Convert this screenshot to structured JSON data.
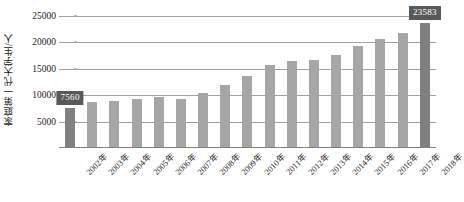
{
  "chart_data": {
    "type": "bar",
    "title": "",
    "xlabel": "",
    "ylabel": "家庭第一代大学生/人",
    "ylim": [
      0,
      25000
    ],
    "yticks": [
      5000,
      10000,
      15000,
      20000,
      25000
    ],
    "ytick_labels": [
      "5000",
      "10000",
      "15000",
      "20000",
      "25000"
    ],
    "grid": true,
    "legend": false,
    "categories": [
      "2002年",
      "2003年",
      "2004年",
      "2005年",
      "2006年",
      "2007年",
      "2008年",
      "2009年",
      "2010年",
      "2011年",
      "2012年",
      "2013年",
      "2014年",
      "2015年",
      "2016年",
      "2017年",
      "2018年"
    ],
    "values": [
      7560,
      8700,
      8900,
      9300,
      9600,
      9200,
      10400,
      11900,
      13700,
      15700,
      16400,
      16700,
      17700,
      19300,
      20700,
      21800,
      23583
    ],
    "annotations": [
      {
        "category": "2002年",
        "value": 7560,
        "label": "7560"
      },
      {
        "category": "2018年",
        "value": 23583,
        "label": "23583"
      }
    ],
    "colors": {
      "bar": "#a6a6a6",
      "bar_accent": "#808080",
      "label_box": "#595959",
      "label_text": "#ffffff",
      "gridline": "#a0a0a0",
      "axis": "#808080",
      "text": "#1a1a1a"
    },
    "accent_indices": [
      0,
      16
    ]
  }
}
